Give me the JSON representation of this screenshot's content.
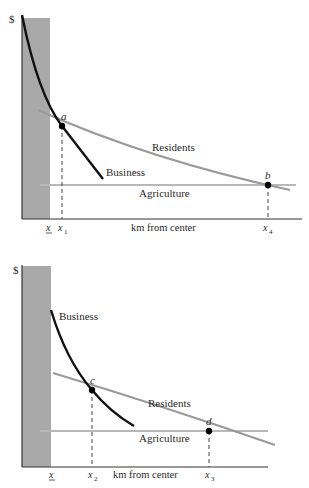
{
  "figures": [
    {
      "id": "top",
      "y_axis_label": "$",
      "x_axis_label": "km from center",
      "curves": {
        "business": "Business",
        "residents": "Residents",
        "agriculture": "Agriculture"
      },
      "points": {
        "first": "a",
        "second": "b"
      },
      "ticks": {
        "xbar": "x",
        "first": "x",
        "first_sub": "1",
        "second": "x",
        "second_sub": "4"
      }
    },
    {
      "id": "bottom",
      "y_axis_label": "$",
      "x_axis_label": "km from center",
      "curves": {
        "business": "Business",
        "residents": "Residents",
        "agriculture": "Agriculture"
      },
      "points": {
        "first": "c",
        "second": "d"
      },
      "ticks": {
        "xbar": "x",
        "first": "x",
        "first_sub": "2",
        "second": "x",
        "second_sub": "3"
      }
    }
  ],
  "colors": {
    "band": "#a9a9a9",
    "business": "#111111",
    "residents": "#9a9a9a",
    "agriculture": "#b5b5b5",
    "axis": "#333333"
  }
}
